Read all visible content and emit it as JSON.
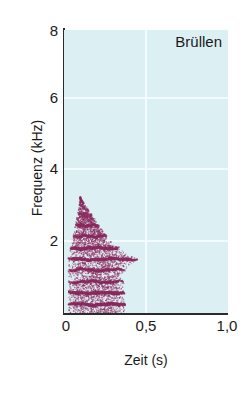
{
  "figure": {
    "panel_title": "Brüllen",
    "background_color": "#dcf0f4",
    "signal_color": "#8b2a5e",
    "axis_color": "#2b2b2b",
    "grid_color": "#f2fbfd"
  },
  "chart_data": {
    "type": "heatmap",
    "title": "Brüllen",
    "xlabel": "Zeit (s)",
    "ylabel": "Frequenz (kHz)",
    "xlim": [
      0,
      1.05
    ],
    "ylim": [
      0,
      8.4
    ],
    "xticks": [
      0,
      0.5,
      1.0
    ],
    "xticklabels": [
      "0",
      "0,5",
      "1,0"
    ],
    "yticks": [
      2,
      4,
      6,
      8
    ],
    "yticklabels": [
      "2",
      "4",
      "6",
      "8"
    ],
    "grid": true,
    "grid_lines": {
      "horizontal_kHz": [
        2,
        4,
        6
      ],
      "vertical_s": [
        0.5
      ]
    },
    "legend": "none",
    "signal": {
      "onset_s": 0.02,
      "offset_s": 0.47,
      "peak_frequency_kHz": 3.7,
      "widest_time_extent_s": 0.46,
      "widest_at_frequency_kHz": 1.85,
      "harmonic_count": 9,
      "harmonic_bands_kHz": [
        0.28,
        0.62,
        0.95,
        1.3,
        1.62,
        1.95,
        2.3,
        2.62,
        2.95
      ],
      "harmonic_spacing_kHz": 0.33
    }
  }
}
